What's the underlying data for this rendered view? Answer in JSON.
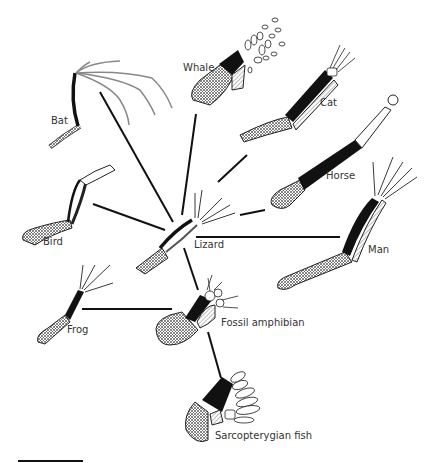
{
  "diagram": {
    "center_node": "Lizard",
    "labels": {
      "bat": "Bat",
      "whale": "Whale",
      "cat": "Cat",
      "horse": "Horse",
      "bird": "Bird",
      "lizard": "Lizard",
      "man": "Man",
      "frog": "Frog",
      "fossil_amphibian": "Fossil amphibian",
      "sarcopterygian_fish": "Sarcopterygian fish"
    },
    "edges": [
      [
        "Lizard",
        "Bat"
      ],
      [
        "Lizard",
        "Whale"
      ],
      [
        "Lizard",
        "Cat"
      ],
      [
        "Lizard",
        "Horse"
      ],
      [
        "Lizard",
        "Bird"
      ],
      [
        "Lizard",
        "Man"
      ],
      [
        "Lizard",
        "Fossil amphibian"
      ],
      [
        "Fossil amphibian",
        "Frog"
      ],
      [
        "Fossil amphibian",
        "Sarcopterygian fish"
      ]
    ],
    "colors": {
      "ink": "#111111",
      "gray_digit": "#888888",
      "hatch": "#777777"
    }
  }
}
